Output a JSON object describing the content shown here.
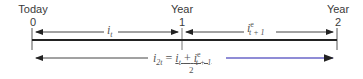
{
  "timeline": {
    "points": [
      {
        "top": "Today",
        "num": "0"
      },
      {
        "top": "Year",
        "num": "1"
      },
      {
        "top": "Year",
        "num": "2"
      }
    ],
    "seg1": {
      "base": "i",
      "sub": "t"
    },
    "seg2": {
      "base": "i",
      "sup": "e",
      "sub": "t + 1"
    },
    "formula": {
      "lhs_base": "i",
      "lhs_sub": "2t",
      "eq": "=",
      "num_a_base": "i",
      "num_a_sub": "t",
      "plus": "+",
      "num_b_base": "i",
      "num_b_sup": "e",
      "num_b_sub": "t + 1",
      "den": "2"
    }
  },
  "colors": {
    "axis": "#222222",
    "arrow": "#444444",
    "blue_arrow": "#6a66c8"
  }
}
